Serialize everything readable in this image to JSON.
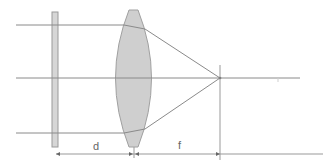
{
  "diagram": {
    "type": "optics-lens-focus",
    "labels": {
      "distance_plate_to_lens": "d",
      "focal_length": "f"
    },
    "colors": {
      "background": "#ffffff",
      "lines": "#888888",
      "lens_fill": "#cfcfcf",
      "lens_stroke": "#9a9a9a",
      "plate_fill": "#d6d6d6"
    },
    "elements": [
      {
        "name": "plate",
        "shape": "thin rectangle"
      },
      {
        "name": "convex-lens",
        "shape": "biconvex"
      },
      {
        "name": "optical-axis",
        "shape": "line"
      },
      {
        "name": "parallel-rays",
        "count": 3
      },
      {
        "name": "focal-point",
        "shape": "point"
      }
    ]
  }
}
